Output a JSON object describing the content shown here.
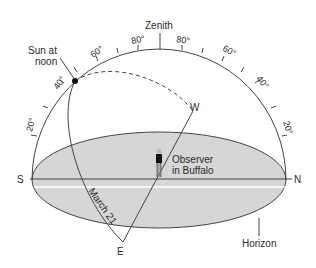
{
  "labels": {
    "zenith": "Zenith",
    "sun_line1": "Sun at",
    "sun_line2": "noon",
    "observer_line1": "Observer",
    "observer_line2": "in Buffalo",
    "march": "March 21",
    "horizon": "Horizon",
    "south": "S",
    "north": "N",
    "east": "E",
    "west": "W"
  },
  "angle_ticks": {
    "left": [
      "20°",
      "40°",
      "60°",
      "80°"
    ],
    "right": [
      "80°",
      "60°",
      "40°",
      "20°"
    ]
  },
  "colors": {
    "horizon_fill": "#d6d6d6",
    "line": "#3a3a3a",
    "background": "#ffffff"
  }
}
